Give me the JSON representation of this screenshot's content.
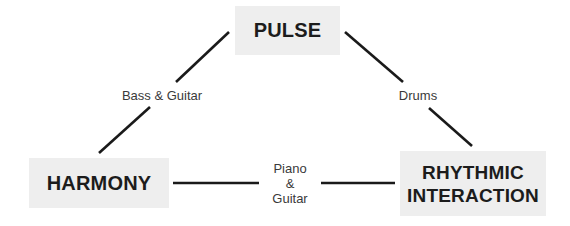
{
  "diagram": {
    "nodes": {
      "pulse": {
        "label": "PULSE"
      },
      "harmony": {
        "label": "HARMONY"
      },
      "rhythmic": {
        "line1": "RHYTHMIC",
        "line2": "INTERACTION"
      }
    },
    "edges": {
      "pulse_harmony": {
        "label": "Bass & Guitar"
      },
      "pulse_rhythmic": {
        "label": "Drums"
      },
      "harmony_rhythmic": {
        "line1": "Piano",
        "line2": "&",
        "line3": "Guitar"
      }
    },
    "colors": {
      "node_fill": "#eeeeee",
      "line": "#1a1a1a",
      "text": "#1c1c1c",
      "edge_text": "#3a3a3a"
    }
  }
}
